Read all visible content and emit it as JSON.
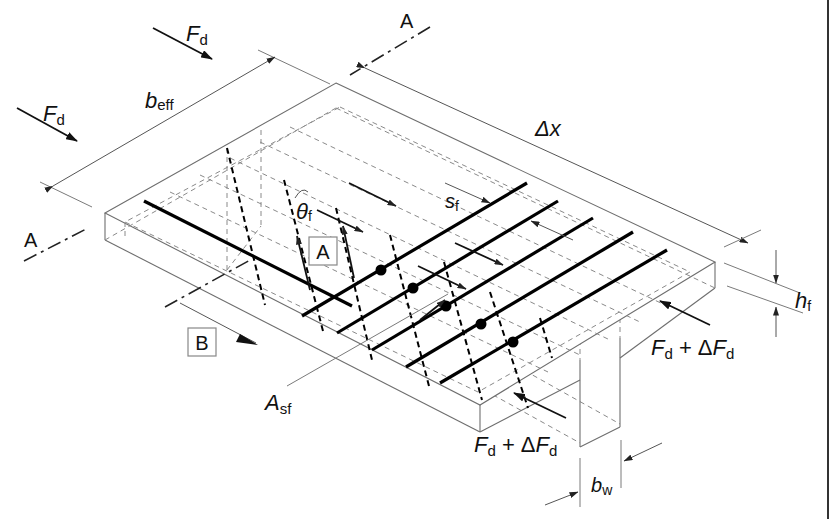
{
  "figure": {
    "labels": {
      "force_top": {
        "main": "F",
        "sub": "d"
      },
      "force_left": {
        "main": "F",
        "sub": "d"
      },
      "force_right": {
        "main": "F",
        "sub": "d",
        "plus": " + Δ",
        "main2": "F",
        "sub2": "d"
      },
      "force_bottom": {
        "main": "F",
        "sub": "d",
        "plus": " + Δ",
        "main2": "F",
        "sub2": "d"
      },
      "effective_width": {
        "main": "b",
        "sub": "eff"
      },
      "length_increment": {
        "main": "Δx"
      },
      "flange_thickness": {
        "main": "h",
        "sub": "f"
      },
      "web_width": {
        "main": "b",
        "sub": "w"
      },
      "bar_spacing": {
        "main": "s",
        "sub": "f"
      },
      "reinforcement_area": {
        "main": "A",
        "sub": "sf"
      },
      "strut_angle": {
        "main": "θ",
        "sub": "f"
      },
      "section_marker_top": "A",
      "section_marker_left": "A",
      "detail_box_a": "A",
      "detail_box_b": "B"
    },
    "colors": {
      "line": "#111111",
      "thin_line": "#7a7a7a",
      "background": "#ffffff"
    }
  }
}
